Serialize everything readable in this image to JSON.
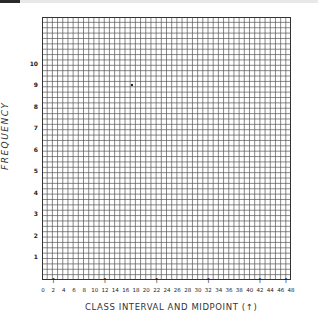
{
  "chart_data": {
    "type": "table",
    "title": "",
    "xlabel": "CLASS INTERVAL AND MIDPOINT (↑)",
    "ylabel": "FREQUENCY",
    "x_tick_labels": [
      "0",
      "2",
      "4",
      "6",
      "8",
      "10",
      "12",
      "14",
      "16",
      "18",
      "20",
      "22",
      "24",
      "26",
      "28",
      "30",
      "32",
      "34",
      "36",
      "38",
      "40",
      "42",
      "44",
      "46",
      "48"
    ],
    "x_midpoint_arrows": [
      2,
      12,
      22,
      32,
      42,
      47
    ],
    "y_tick_labels": [
      "1",
      "2",
      "3",
      "4",
      "5",
      "6",
      "7",
      "8",
      "9",
      "10"
    ],
    "xlim": [
      0,
      48
    ],
    "ylim": [
      0,
      12
    ],
    "grid": true,
    "grid_columns": 48,
    "grid_rows": 49,
    "series": []
  },
  "axis": {
    "y_title": "FREQUENCY",
    "x_title": "CLASS INTERVAL AND MIDPOINT (↑)",
    "arrow_glyph": "↑"
  },
  "colors": {
    "grid_line": "#555555",
    "text": "#222222",
    "background": "#ffffff"
  }
}
